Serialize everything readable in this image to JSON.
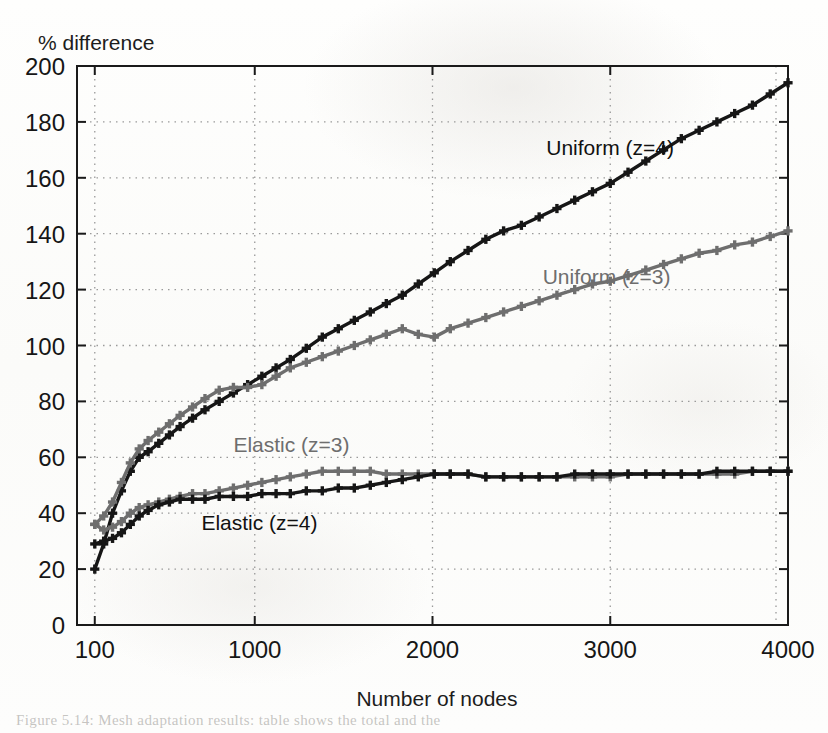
{
  "figure": {
    "background_color": "#fdfdfc",
    "plot_frame_color": "#1a1a1a",
    "grid_color": "#9a9a9a"
  },
  "ghost_caption": {
    "text": "Figure 5.14: Mesh adaptation results: table shows the total and the",
    "visible": true
  },
  "chart_data": {
    "type": "line",
    "title": "",
    "xlabel": "Number of nodes",
    "ylabel": "% difference",
    "xlim": [
      0,
      4000
    ],
    "ylim": [
      0,
      200
    ],
    "xticks": [
      100,
      1000,
      2000,
      3000,
      4000
    ],
    "xtick_labels": [
      "100",
      "1000",
      "2000",
      "3000",
      "4000"
    ],
    "yticks": [
      0,
      20,
      40,
      60,
      80,
      100,
      120,
      140,
      160,
      180,
      200
    ],
    "ytick_labels": [
      "0",
      "20",
      "40",
      "60",
      "80",
      "100",
      "120",
      "140",
      "160",
      "180",
      "200"
    ],
    "grid": true,
    "grid_style": "dotted",
    "legend": "inline-annotations",
    "marker": "plus-square",
    "series": [
      {
        "name": "Uniform (z=4)",
        "color": "#161616",
        "label_x": 2640,
        "label_y": 168,
        "x": [
          100,
          150,
          200,
          250,
          300,
          350,
          400,
          460,
          520,
          580,
          650,
          720,
          800,
          880,
          960,
          1040,
          1120,
          1200,
          1290,
          1380,
          1470,
          1560,
          1650,
          1740,
          1830,
          1920,
          2010,
          2100,
          2200,
          2300,
          2400,
          2500,
          2600,
          2700,
          2800,
          2900,
          3000,
          3100,
          3200,
          3300,
          3400,
          3500,
          3600,
          3700,
          3800,
          3900,
          4000
        ],
        "y": [
          20,
          29,
          40,
          48,
          55,
          60,
          62,
          65,
          68,
          71,
          74,
          77,
          80,
          83,
          86,
          89,
          92,
          95,
          99,
          103,
          106,
          109,
          112,
          115,
          118,
          122,
          126,
          130,
          134,
          138,
          141,
          143,
          146,
          149,
          152,
          155,
          158,
          162,
          166,
          170,
          174,
          177,
          180,
          183,
          186,
          190,
          194
        ]
      },
      {
        "name": "Uniform (z=3)",
        "color": "#6e6e6e",
        "label_x": 2620,
        "label_y": 122,
        "x": [
          100,
          150,
          200,
          250,
          300,
          350,
          400,
          460,
          520,
          580,
          650,
          720,
          800,
          880,
          960,
          1040,
          1120,
          1200,
          1290,
          1380,
          1470,
          1560,
          1650,
          1740,
          1830,
          1920,
          2010,
          2100,
          2200,
          2300,
          2400,
          2500,
          2600,
          2700,
          2800,
          2900,
          3000,
          3100,
          3200,
          3300,
          3400,
          3500,
          3600,
          3700,
          3800,
          3900,
          4000
        ],
        "y": [
          36,
          39,
          44,
          51,
          58,
          63,
          66,
          69,
          72,
          75,
          78,
          81,
          84,
          85,
          85,
          86,
          89,
          92,
          94,
          96,
          98,
          100,
          102,
          104,
          106,
          104,
          103,
          106,
          108,
          110,
          112,
          114,
          116,
          118,
          120,
          122,
          123,
          125,
          127,
          129,
          131,
          133,
          134,
          136,
          137,
          139,
          141
        ]
      },
      {
        "name": "Elastic (z=3)",
        "color": "#6e6e6e",
        "label_x": 880,
        "label_y": 62,
        "x": [
          100,
          150,
          200,
          250,
          300,
          350,
          400,
          460,
          520,
          580,
          650,
          720,
          800,
          880,
          960,
          1040,
          1120,
          1200,
          1290,
          1380,
          1470,
          1560,
          1650,
          1740,
          1830,
          1920,
          2010,
          2100,
          2200,
          2300,
          2400,
          2500,
          2600,
          2700,
          2800,
          2900,
          3000,
          3100,
          3200,
          3300,
          3400,
          3500,
          3600,
          3700,
          3800,
          3900,
          4000
        ],
        "y": [
          36,
          34,
          35,
          37,
          40,
          42,
          43,
          44,
          45,
          46,
          47,
          47,
          48,
          49,
          50,
          51,
          52,
          53,
          54,
          55,
          55,
          55,
          55,
          54,
          54,
          54,
          54,
          54,
          54,
          53,
          53,
          53,
          53,
          53,
          53,
          53,
          53,
          54,
          54,
          54,
          54,
          54,
          54,
          54,
          55,
          55,
          55
        ]
      },
      {
        "name": "Elastic (z=4)",
        "color": "#161616",
        "label_x": 700,
        "label_y": 34,
        "x": [
          100,
          150,
          200,
          250,
          300,
          350,
          400,
          460,
          520,
          580,
          650,
          720,
          800,
          880,
          960,
          1040,
          1120,
          1200,
          1290,
          1380,
          1470,
          1560,
          1650,
          1740,
          1830,
          1920,
          2010,
          2100,
          2200,
          2300,
          2400,
          2500,
          2600,
          2700,
          2800,
          2900,
          3000,
          3100,
          3200,
          3300,
          3400,
          3500,
          3600,
          3700,
          3800,
          3900,
          4000
        ],
        "y": [
          29,
          30,
          31,
          33,
          36,
          39,
          41,
          43,
          44,
          45,
          45,
          45,
          46,
          46,
          46,
          47,
          47,
          47,
          48,
          48,
          49,
          49,
          50,
          51,
          52,
          53,
          54,
          54,
          54,
          53,
          53,
          53,
          53,
          53,
          54,
          54,
          54,
          54,
          54,
          54,
          54,
          54,
          55,
          55,
          55,
          55,
          55
        ]
      }
    ]
  }
}
